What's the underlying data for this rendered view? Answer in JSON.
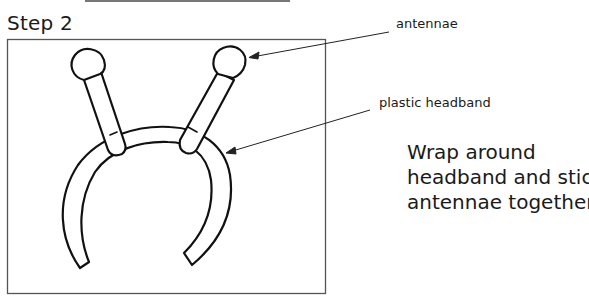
{
  "header": {
    "title": "Step 2"
  },
  "diagram": {
    "labels": {
      "antennae": "antennae",
      "headband": "plastic headband"
    },
    "colors": {
      "line": "#111111",
      "frame": "#555555",
      "background": "#ffffff"
    }
  },
  "instructions": {
    "lines": [
      "Wrap around",
      "headband and stick",
      "antennae together."
    ]
  }
}
